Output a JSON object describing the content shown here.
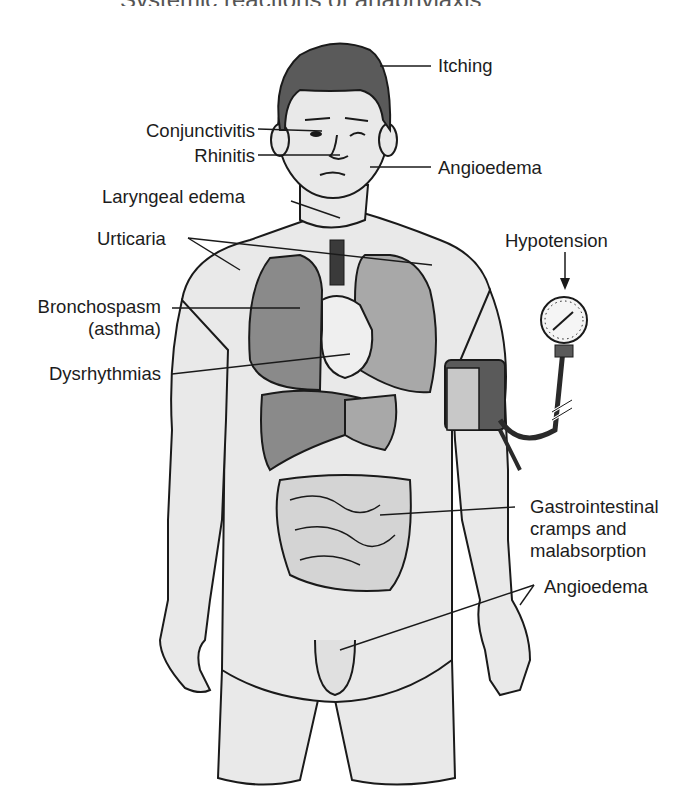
{
  "figure": {
    "title_fragment": "Systemic reactions of anaphylaxis",
    "colors": {
      "skin": "#e9e9e9",
      "outline": "#1a1a1a",
      "hair": "#5a5a5a",
      "organ_dark": "#8a8a8a",
      "organ_mid": "#a8a8a8",
      "organ_light": "#d4d4d4",
      "heart": "#efefef",
      "label_text": "#1c1c1c"
    },
    "labels": {
      "itching": "Itching",
      "conjunctivitis": "Conjunctivitis",
      "rhinitis": "Rhinitis",
      "angioedema_face": "Angioedema",
      "laryngeal_edema": "Laryngeal edema",
      "urticaria": "Urticaria",
      "hypotension": "Hypotension",
      "bronchospasm_line1": "Bronchospasm",
      "bronchospasm_line2": "(asthma)",
      "dysrhythmias": "Dysrhythmias",
      "gi_line1": "Gastrointestinal",
      "gi_line2": "cramps and",
      "gi_line3": "malabsorption",
      "angioedema_lower": "Angioedema"
    }
  }
}
